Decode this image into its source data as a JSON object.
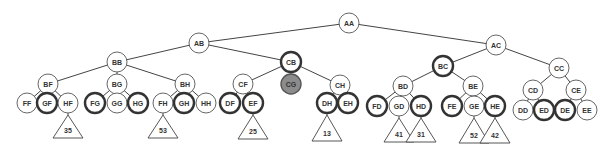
{
  "diagram": {
    "type": "tree",
    "nodes": [
      {
        "id": "AA",
        "label": "AA",
        "style": "normal",
        "parent": null
      },
      {
        "id": "AB",
        "label": "AB",
        "style": "normal",
        "parent": "AA"
      },
      {
        "id": "AC",
        "label": "AC",
        "style": "normal",
        "parent": "AA"
      },
      {
        "id": "BB",
        "label": "BB",
        "style": "normal",
        "parent": "AB"
      },
      {
        "id": "CB",
        "label": "CB",
        "style": "bold",
        "parent": "AB"
      },
      {
        "id": "BC",
        "label": "BC",
        "style": "bold",
        "parent": "AC"
      },
      {
        "id": "CC",
        "label": "CC",
        "style": "normal",
        "parent": "AC"
      },
      {
        "id": "BF",
        "label": "BF",
        "style": "normal",
        "parent": "BB"
      },
      {
        "id": "BG",
        "label": "BG",
        "style": "normal",
        "parent": "BB"
      },
      {
        "id": "BH",
        "label": "BH",
        "style": "normal",
        "parent": "BB"
      },
      {
        "id": "CF",
        "label": "CF",
        "style": "normal",
        "parent": "CB"
      },
      {
        "id": "CG",
        "label": "CG",
        "style": "filled",
        "parent": "CB"
      },
      {
        "id": "CH",
        "label": "CH",
        "style": "normal",
        "parent": "CB"
      },
      {
        "id": "BD",
        "label": "BD",
        "style": "normal",
        "parent": "BC"
      },
      {
        "id": "BE",
        "label": "BE",
        "style": "normal",
        "parent": "BC"
      },
      {
        "id": "CD",
        "label": "CD",
        "style": "normal",
        "parent": "CC"
      },
      {
        "id": "CE",
        "label": "CE",
        "style": "normal",
        "parent": "CC"
      },
      {
        "id": "FF",
        "label": "FF",
        "style": "normal",
        "parent": "BF"
      },
      {
        "id": "GF",
        "label": "GF",
        "style": "bold",
        "parent": "BF"
      },
      {
        "id": "HF",
        "label": "HF",
        "style": "normal",
        "parent": "BF"
      },
      {
        "id": "FG",
        "label": "FG",
        "style": "bold",
        "parent": "BG"
      },
      {
        "id": "GG",
        "label": "GG",
        "style": "normal",
        "parent": "BG"
      },
      {
        "id": "HG",
        "label": "HG",
        "style": "bold",
        "parent": "BG"
      },
      {
        "id": "FH",
        "label": "FH",
        "style": "normal",
        "parent": "BH"
      },
      {
        "id": "GH",
        "label": "GH",
        "style": "bold",
        "parent": "BH"
      },
      {
        "id": "HH",
        "label": "HH",
        "style": "normal",
        "parent": "BH"
      },
      {
        "id": "DF",
        "label": "DF",
        "style": "bold",
        "parent": "CF"
      },
      {
        "id": "EF",
        "label": "EF",
        "style": "bold",
        "parent": "CF"
      },
      {
        "id": "DH",
        "label": "DH",
        "style": "bold",
        "parent": "CH"
      },
      {
        "id": "EH",
        "label": "EH",
        "style": "bold",
        "parent": "CH"
      },
      {
        "id": "FD",
        "label": "FD",
        "style": "bold",
        "parent": "BD"
      },
      {
        "id": "GD",
        "label": "GD",
        "style": "normal",
        "parent": "BD"
      },
      {
        "id": "HD",
        "label": "HD",
        "style": "bold",
        "parent": "BD"
      },
      {
        "id": "FE",
        "label": "FE",
        "style": "bold",
        "parent": "BE"
      },
      {
        "id": "GE",
        "label": "GE",
        "style": "normal",
        "parent": "BE"
      },
      {
        "id": "HE",
        "label": "HE",
        "style": "bold",
        "parent": "BE"
      },
      {
        "id": "DD",
        "label": "DD",
        "style": "normal",
        "parent": "CD"
      },
      {
        "id": "ED",
        "label": "ED",
        "style": "bold",
        "parent": "CD"
      },
      {
        "id": "DE",
        "label": "DE",
        "style": "bold",
        "parent": "CE"
      },
      {
        "id": "EE",
        "label": "EE",
        "style": "normal",
        "parent": "CE"
      }
    ],
    "subtrees": [
      {
        "parent": "HF",
        "label": "35"
      },
      {
        "parent": "FH",
        "label": "53"
      },
      {
        "parent": "EF",
        "label": "25"
      },
      {
        "parent": "DH",
        "label": "13"
      },
      {
        "parent": "GD",
        "label": "41"
      },
      {
        "parent": "HD",
        "label": "31"
      },
      {
        "parent": "GE",
        "label": "52"
      },
      {
        "parent": "HE",
        "label": "42"
      }
    ],
    "colors": {
      "filled_node": "#8c8c8c",
      "stroke": "#444444"
    }
  }
}
